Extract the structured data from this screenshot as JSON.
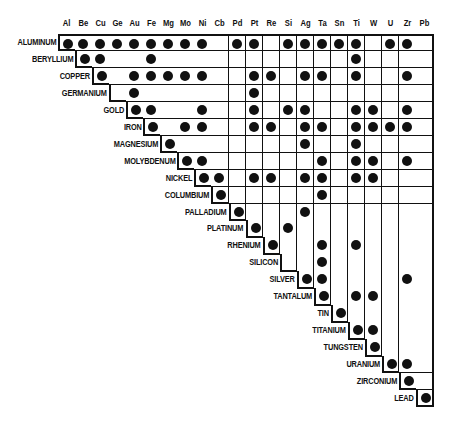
{
  "columns": [
    "Al",
    "Be",
    "Cu",
    "Ge",
    "Au",
    "Fe",
    "Mg",
    "Mo",
    "Ni",
    "Cb",
    "Pd",
    "Pt",
    "Re",
    "Si",
    "Ag",
    "Ta",
    "Sn",
    "Ti",
    "W",
    "U",
    "Zr",
    "Pb"
  ],
  "rows": [
    {
      "label": "ALUMINUM",
      "dots": [
        0,
        1,
        2,
        3,
        4,
        5,
        6,
        7,
        8,
        10,
        11,
        13,
        14,
        15,
        16,
        17,
        19,
        20
      ]
    },
    {
      "label": "BERYLLIUM",
      "dots": [
        1,
        2,
        5,
        17
      ]
    },
    {
      "label": "COPPER",
      "dots": [
        2,
        4,
        5,
        6,
        7,
        8,
        11,
        12,
        14,
        15,
        17,
        20
      ]
    },
    {
      "label": "GERMANIUM",
      "dots": [
        4,
        11
      ]
    },
    {
      "label": "GOLD",
      "dots": [
        4,
        5,
        8,
        11,
        13,
        14,
        17,
        18,
        20
      ]
    },
    {
      "label": "IRON",
      "dots": [
        5,
        7,
        8,
        11,
        12,
        14,
        15,
        17,
        18,
        19,
        20
      ]
    },
    {
      "label": "MAGNESIUM",
      "dots": [
        6,
        14,
        17
      ]
    },
    {
      "label": "MOLYBDENUM",
      "dots": [
        7,
        8,
        15,
        17,
        18,
        20
      ]
    },
    {
      "label": "NICKEL",
      "dots": [
        8,
        9,
        11,
        12,
        14,
        15,
        17,
        18
      ]
    },
    {
      "label": "COLUMBIUM",
      "dots": [
        9,
        15
      ]
    },
    {
      "label": "PALLADIUM",
      "dots": [
        10,
        14
      ]
    },
    {
      "label": "PLATINUM",
      "dots": [
        11,
        13
      ]
    },
    {
      "label": "RHENIUM",
      "dots": [
        12,
        15,
        17
      ]
    },
    {
      "label": "SILICON",
      "dots": [
        15
      ]
    },
    {
      "label": "SILVER",
      "dots": [
        14,
        15,
        20
      ]
    },
    {
      "label": "TANTALUM",
      "dots": [
        15,
        17,
        18
      ]
    },
    {
      "label": "TIN",
      "dots": [
        16
      ]
    },
    {
      "label": "TITANIUM",
      "dots": [
        17,
        18
      ]
    },
    {
      "label": "TUNGSTEN",
      "dots": [
        18
      ]
    },
    {
      "label": "URANIUM",
      "dots": [
        19,
        20
      ]
    },
    {
      "label": "ZIRCONIUM",
      "dots": [
        20
      ]
    },
    {
      "label": "LEAD",
      "dots": [
        21
      ]
    }
  ],
  "colors": {
    "ink": "#111111",
    "background": "#ffffff"
  }
}
